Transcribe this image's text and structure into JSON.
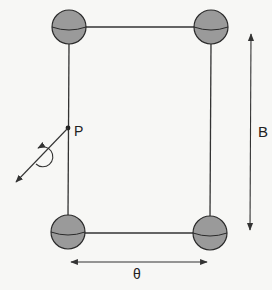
{
  "diagram": {
    "labels": {
      "point": "P",
      "field": "B",
      "angle": "θ"
    },
    "colors": {
      "background": "#f7f7f5",
      "line": "#333333",
      "sphere_fill": "#9a9a9a",
      "sphere_stroke": "#2a2a2a"
    },
    "elements": {
      "spheres": [
        "top-left",
        "top-right",
        "bottom-left",
        "bottom-right"
      ],
      "wires": [
        "top",
        "bottom",
        "left",
        "right"
      ],
      "arrows": [
        "B double-headed vertical",
        "θ double-headed horizontal",
        "rotation axis at P"
      ]
    }
  }
}
